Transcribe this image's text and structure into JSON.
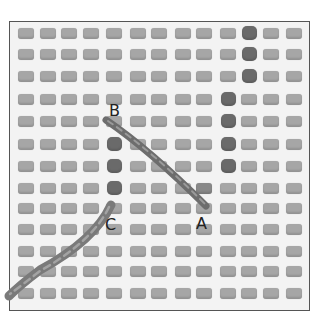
{
  "figure": {
    "labels": [
      {
        "id": "A",
        "text": "A",
        "x": 196,
        "y": 216
      },
      {
        "id": "B",
        "text": "B",
        "x": 109,
        "y": 103
      },
      {
        "id": "C",
        "text": "C",
        "x": 105,
        "y": 217
      }
    ],
    "grid": {
      "columns": 13,
      "rows": 13,
      "col_centers": [
        25,
        47,
        68,
        90,
        113,
        137,
        158,
        182,
        203,
        227,
        248,
        270,
        293
      ],
      "row_centers": [
        32,
        53,
        75,
        98,
        120,
        143,
        165,
        187,
        207,
        228,
        250,
        270,
        292
      ]
    },
    "filled_holes": [
      [
        0,
        10
      ],
      [
        1,
        10
      ],
      [
        2,
        10
      ],
      [
        3,
        9
      ],
      [
        4,
        9
      ],
      [
        5,
        9
      ],
      [
        6,
        9
      ],
      [
        5,
        4
      ],
      [
        6,
        4
      ],
      [
        7,
        4
      ]
    ],
    "half_filled_holes": [
      [
        7,
        8
      ]
    ],
    "colors": {
      "canvas": "#f3f3f3",
      "hole": "#a6a6a6",
      "filled_hole": "#6a6a6a",
      "yarn": "#707070",
      "frame": "#555555"
    }
  }
}
